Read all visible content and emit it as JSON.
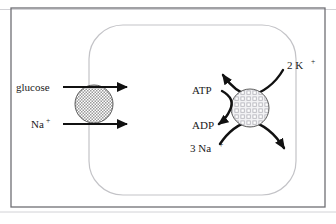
{
  "figure": {
    "frame": {
      "outer_border_color": "#6f6f74",
      "hairline_color": "#d2d2d6",
      "background_color": "#ffffff"
    },
    "membrane": {
      "name": "cell-membrane",
      "stroke_color": "#c3c3c7",
      "shape": "rounded-rectangle"
    }
  },
  "left_transporter": {
    "name": "glucose-sodium-cotransporter",
    "fill_pattern": "fine-stipple-gray",
    "fill_color": "#b6b6b6",
    "outline_color": "#4a4a4a",
    "labels": {
      "glucose": "glucose",
      "sodium_base": "Na",
      "sodium_charge": "+"
    },
    "arrows": [
      {
        "name": "glucose-influx-arrow",
        "label": "glucose",
        "direction": "inward"
      },
      {
        "name": "sodium-influx-arrow",
        "label": "Na+",
        "direction": "inward"
      }
    ]
  },
  "right_pump": {
    "name": "sodium-potassium-atpase-pump",
    "fill_pattern": "checkered-grid",
    "fill_color": "#d8d8dc",
    "outline_color": "#4a4a4a",
    "labels": {
      "atp": "ATP",
      "adp": "ADP",
      "potassium_count": "2 K",
      "potassium_charge": "+",
      "sodium_count": "3 Na",
      "sodium_charge": "+"
    },
    "arrows": [
      {
        "name": "atp-to-adp-arrow",
        "from": "ATP",
        "to": "ADP",
        "direction": "hydrolysis"
      },
      {
        "name": "potassium-influx-arrow",
        "label": "2 K+",
        "direction": "inward"
      },
      {
        "name": "sodium-efflux-arrow",
        "label": "3 Na+",
        "direction": "outward"
      }
    ]
  }
}
